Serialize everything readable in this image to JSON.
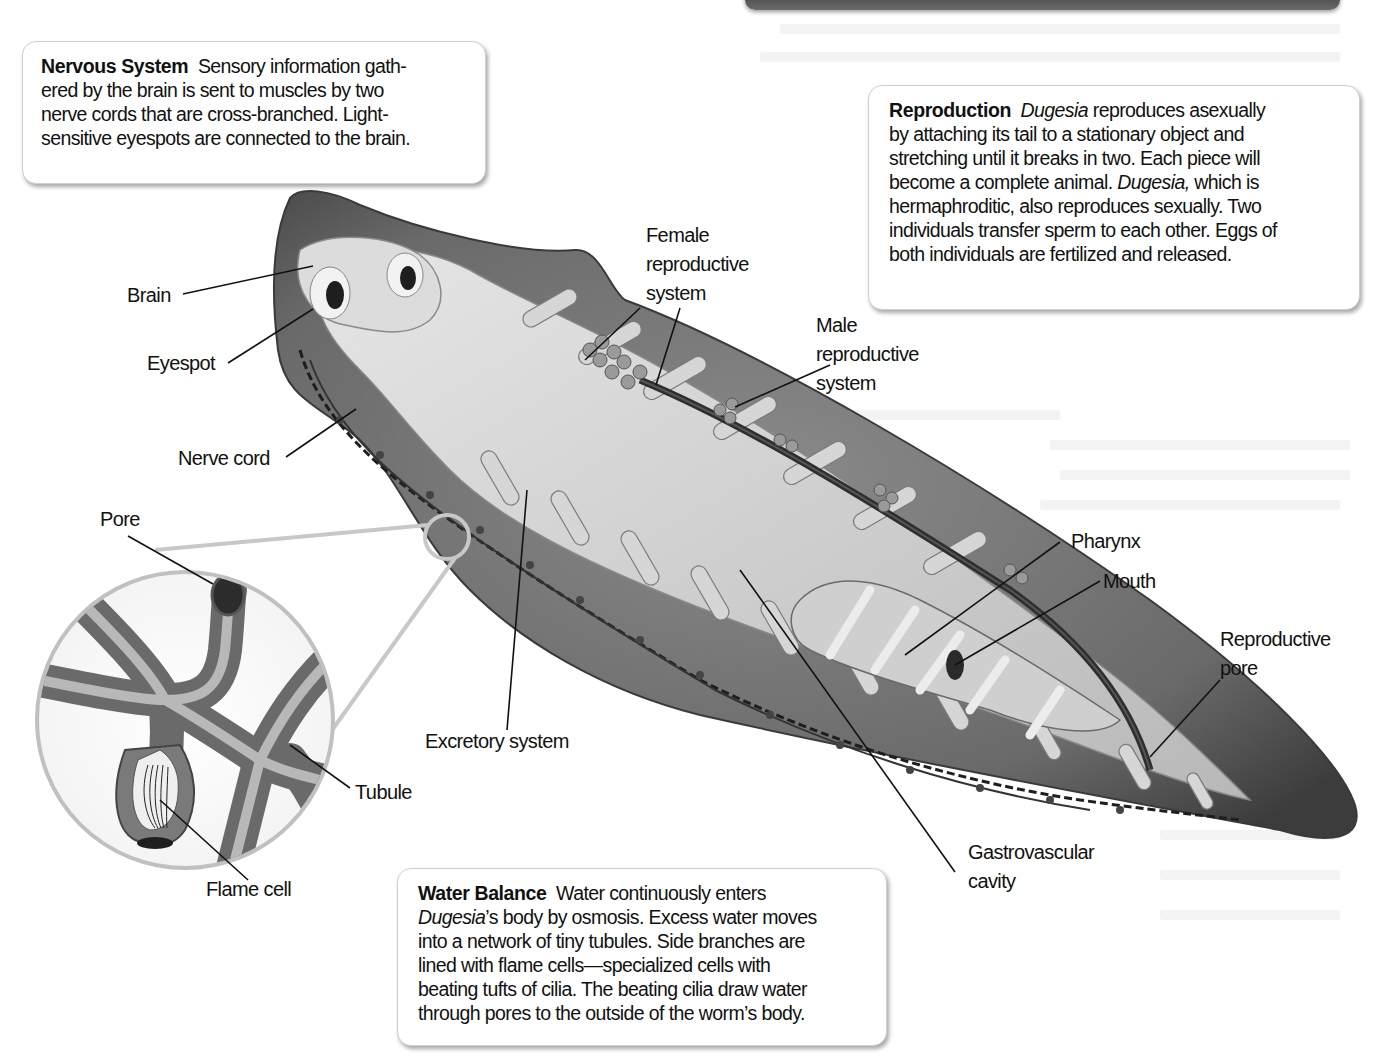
{
  "figure": {
    "callouts": {
      "nervous_system": {
        "title": "Nervous System",
        "lines": [
          "Sensory information gath-",
          "ered by the brain is sent to muscles by two",
          "nerve cords that are cross-branched. Light-",
          "sensitive eyespots are connected to the brain."
        ]
      },
      "reproduction": {
        "title": "Reproduction",
        "italic_term": "Dugesia",
        "line1_rest": " reproduces asexually",
        "lines": [
          "by attaching its tail to a stationary object and",
          "stretching until it breaks in two. Each piece will"
        ],
        "line4_pre": "become a complete animal. ",
        "line4_italic": "Dugesia,",
        "line4_post": " which is",
        "lines_end": [
          "hermaphroditic, also reproduces sexually. Two",
          "individuals transfer sperm to each other. Eggs of",
          "both individuals are fertilized and released."
        ]
      },
      "water_balance": {
        "title": "Water Balance",
        "line1_rest": "Water continuously enters",
        "line2_italic": "Dugesia",
        "line2_rest": "’s body by osmosis. Excess water moves",
        "lines": [
          "into a network of tiny tubules. Side branches are",
          "lined with flame cells—specialized cells with",
          "beating tufts of cilia. The beating cilia draw water",
          "through pores to the outside of the worm’s body."
        ]
      }
    },
    "labels": {
      "brain": "Brain",
      "eyespot": "Eyespot",
      "nerve_cord": "Nerve cord",
      "female_repro": [
        "Female",
        "reproductive",
        "system"
      ],
      "male_repro": [
        "Male",
        "reproductive",
        "system"
      ],
      "pharynx": "Pharynx",
      "mouth": "Mouth",
      "repro_pore": [
        "Reproductive",
        "pore"
      ],
      "gastro": [
        "Gastrovascular",
        "cavity"
      ],
      "excretory": "Excretory system",
      "pore": "Pore",
      "tubule": "Tubule",
      "flame_cell": "Flame cell"
    },
    "colors": {
      "body": "#6e6e6e",
      "gut": "#c9c9c9",
      "dark": "#2e2e2e",
      "callout_border": "#cfcfcf"
    }
  }
}
